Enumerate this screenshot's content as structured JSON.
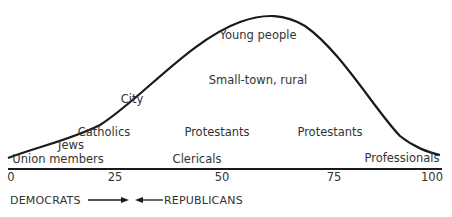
{
  "diagram": {
    "axis": {
      "ticks": [
        "0",
        "25",
        "50",
        "75",
        "100"
      ]
    },
    "labels": {
      "young_people": "Young people",
      "small_town_rural": "Small-town, rural",
      "city": "City",
      "catholics": "Catholics",
      "protestants_mid": "Protestants",
      "protestants_right": "Protestants",
      "jews": "Jews",
      "union_members": "Union members",
      "clericals": "Clericals",
      "professionals": "Professionals"
    },
    "legend": {
      "left": "DEMOCRATS",
      "right": "REPUBLICANS"
    },
    "colors": {
      "line": "#1a1a1a",
      "text": "#333333"
    }
  }
}
